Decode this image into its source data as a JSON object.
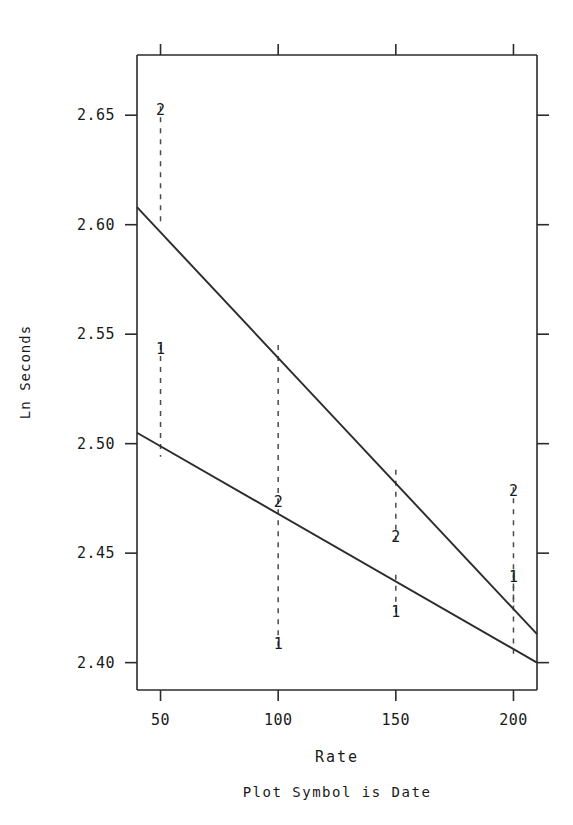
{
  "chart_data": {
    "type": "line",
    "title": "",
    "xlabel": "Rate",
    "ylabel": "Ln Seconds",
    "footnote": "Plot Symbol is Date",
    "grid": false,
    "legend": "none",
    "xlim": [
      40,
      210
    ],
    "ylim": [
      2.3875,
      2.6775
    ],
    "xticks": [
      50,
      100,
      150,
      200
    ],
    "xtick_labels": [
      "50",
      "100",
      "150",
      "200"
    ],
    "yticks": [
      2.4,
      2.45,
      2.5,
      2.55,
      2.6,
      2.65
    ],
    "ytick_labels": [
      "2.40",
      "2.45",
      "2.50",
      "2.55",
      "2.60",
      "2.65"
    ],
    "series": [
      {
        "name": "Date 2 fit",
        "style": "solid",
        "x": [
          40,
          210
        ],
        "values": [
          2.608,
          2.413
        ]
      },
      {
        "name": "Date 1 fit",
        "style": "solid",
        "x": [
          40,
          210
        ],
        "values": [
          2.505,
          2.4
        ]
      }
    ],
    "points": [
      {
        "symbol": "2",
        "x": 50,
        "y": 2.65,
        "drop_to": 2.6
      },
      {
        "symbol": "1",
        "x": 50,
        "y": 2.541,
        "drop_to": 2.494
      },
      {
        "symbol": "2",
        "x": 100,
        "y": 2.471,
        "drop_to": 2.541
      },
      {
        "symbol": "1",
        "x": 100,
        "y": 2.406,
        "drop_to": 2.471
      },
      {
        "symbol": "2",
        "x": 150,
        "y": 2.455,
        "drop_to": 2.484
      },
      {
        "symbol": "1",
        "x": 150,
        "y": 2.421,
        "drop_to": 2.436
      },
      {
        "symbol": "2",
        "x": 200,
        "y": 2.476,
        "drop_to": 2.427
      },
      {
        "symbol": "1",
        "x": 200,
        "y": 2.437,
        "drop_to": 2.404
      }
    ]
  },
  "axes": {
    "x_title": "Rate",
    "y_title": "Ln Seconds",
    "footnote": "Plot Symbol is Date"
  },
  "colors": {
    "ink": "#1a1a1a",
    "line": "#2b2b2b",
    "dashed": "#4a4a4a",
    "background": "#ffffff"
  }
}
